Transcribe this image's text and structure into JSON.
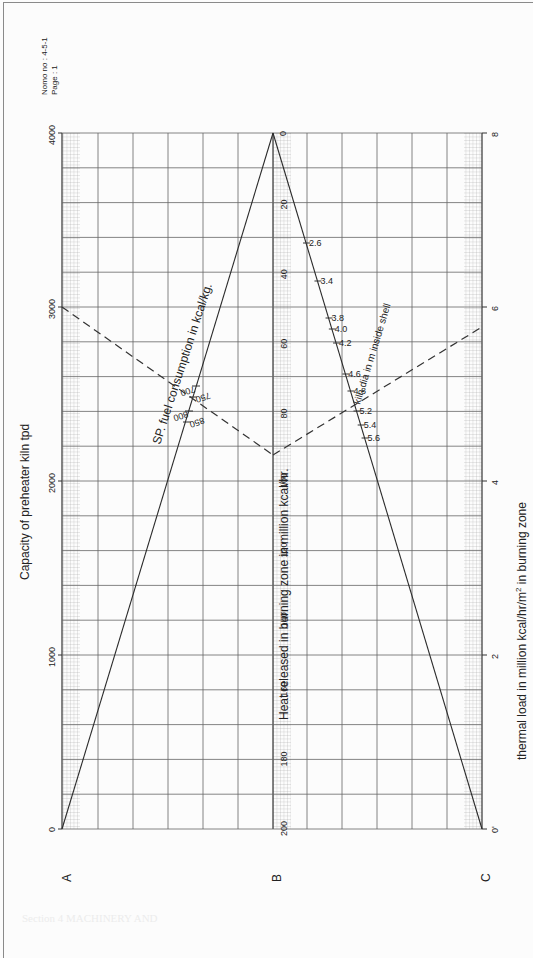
{
  "document": {
    "nomo_no": "Nomo no : 4-5-1",
    "page": "Page     : 1",
    "bleed_text": [
      "Section 4 MACHINERY AND"
    ]
  },
  "chart_data": {
    "type": "nomogram",
    "title": "Capacity of preheater kiln tpd",
    "orientation": "rotated 90° counter-clockwise",
    "axes": [
      {
        "id": "A",
        "label": "Capacity of preheater kiln tpd",
        "range": [
          0,
          4000
        ],
        "ticks": [
          0,
          1000,
          2000,
          3000,
          4000
        ],
        "tick_labels": [
          "0",
          "1000",
          "2000",
          "3000",
          "4000"
        ]
      },
      {
        "id": "B",
        "label": "Heat released in burning zone in  million kcal/hr.",
        "range": [
          0,
          200
        ],
        "ticks": [
          0,
          20,
          40,
          60,
          80,
          100,
          120,
          140,
          160,
          180,
          200
        ],
        "tick_labels": [
          "0",
          "20",
          "40",
          "60",
          "80",
          "100",
          "120",
          "140",
          "160",
          "180",
          "200"
        ]
      },
      {
        "id": "C",
        "label": "thermal load in million kcal/hr/m² in burning zone",
        "range": [
          0,
          8
        ],
        "ticks": [
          0,
          2,
          4,
          6,
          8
        ],
        "tick_labels": [
          "0'",
          "2",
          "4",
          "6",
          "8"
        ]
      }
    ],
    "auxiliary_scales": [
      {
        "name": "SP. fuel consumption in kcal/kg.",
        "ticks": [
          700,
          750,
          800,
          850
        ],
        "tick_labels": [
          "700",
          "750",
          "800",
          "850"
        ]
      },
      {
        "name": "kiln dia in m inside shell",
        "ticks": [
          2.6,
          3.4,
          3.8,
          4.0,
          4.2,
          4.6,
          4.8,
          5.2,
          5.4,
          5.6
        ],
        "tick_labels": [
          "2.6",
          "3.4",
          "3.8",
          "4.0",
          "4.2",
          "4.6",
          "4.8",
          "5.2",
          "5.4",
          "5.6"
        ]
      }
    ],
    "example_solution": {
      "capacity_tpd": 3000,
      "sp_fuel_kcal_per_kg": 750,
      "heat_released_million_kcal_hr": 93,
      "kiln_dia_m": 5.2,
      "thermal_load": 5.4
    },
    "grid": true
  },
  "labels": {
    "axis_a_letter": "A",
    "axis_b_letter": "B",
    "axis_c_letter": "C",
    "axis_a_title": "Capacity of preheater kiln tpd",
    "axis_b_title": "Heat released in burning zone in  million kcal/hr.",
    "axis_c_title_pre": "thermal load in million kcal/hr/m",
    "axis_c_title_sup": "2",
    "axis_c_title_post": " in burning zone",
    "sp_fuel_title": "SP. fuel consumption in kcal/kg.",
    "kiln_dia_title": "kiln dia in m inside shell"
  },
  "colors": {
    "line": "#2a2a2a",
    "grid": "#555555",
    "fine_grid": "#9a9a9a",
    "dashed": "#333333"
  }
}
